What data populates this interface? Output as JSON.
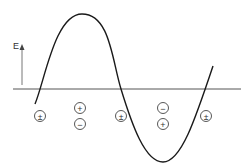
{
  "figure": {
    "axis_label": "E",
    "colors": {
      "curve": "#1a1a1a",
      "axis": "#555555",
      "symbols": "#444444",
      "background": "#ffffff"
    },
    "curve": {
      "type": "sine-wave",
      "description": "Electric field E oscillating over one-plus wavelength along the propagation line"
    },
    "charge_markers": [
      {
        "x": 40,
        "symbols": [
          "±"
        ]
      },
      {
        "x": 80,
        "symbols": [
          "+",
          "−"
        ]
      },
      {
        "x": 121,
        "symbols": [
          "±"
        ]
      },
      {
        "x": 163,
        "symbols": [
          "−",
          "+"
        ]
      },
      {
        "x": 206,
        "symbols": [
          "±"
        ]
      }
    ]
  }
}
